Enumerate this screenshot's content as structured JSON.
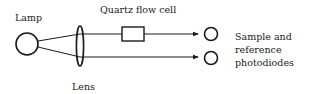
{
  "diagram": {
    "type": "optical-schematic",
    "labels": {
      "lamp": "Lamp",
      "flow_cell": "Quartz flow cell",
      "lens": "Lens",
      "photodiodes_line1": "Sample and",
      "photodiodes_line2": "reference",
      "photodiodes_line3": "photodiodes"
    },
    "components": [
      {
        "id": "lamp",
        "shape": "circle"
      },
      {
        "id": "lens",
        "shape": "ellipse"
      },
      {
        "id": "quartz-flow-cell",
        "shape": "rectangle"
      },
      {
        "id": "sample-photodiode",
        "shape": "circle"
      },
      {
        "id": "reference-photodiode",
        "shape": "circle"
      }
    ],
    "connections": [
      {
        "from": "lamp",
        "to": "lens"
      },
      {
        "from": "lens",
        "to": "sample-photodiode",
        "via": "quartz-flow-cell",
        "arrow": true
      },
      {
        "from": "lens",
        "to": "reference-photodiode",
        "arrow": true
      }
    ],
    "colors": {
      "stroke": "#1a1a1a",
      "background": "#ffffff"
    }
  }
}
